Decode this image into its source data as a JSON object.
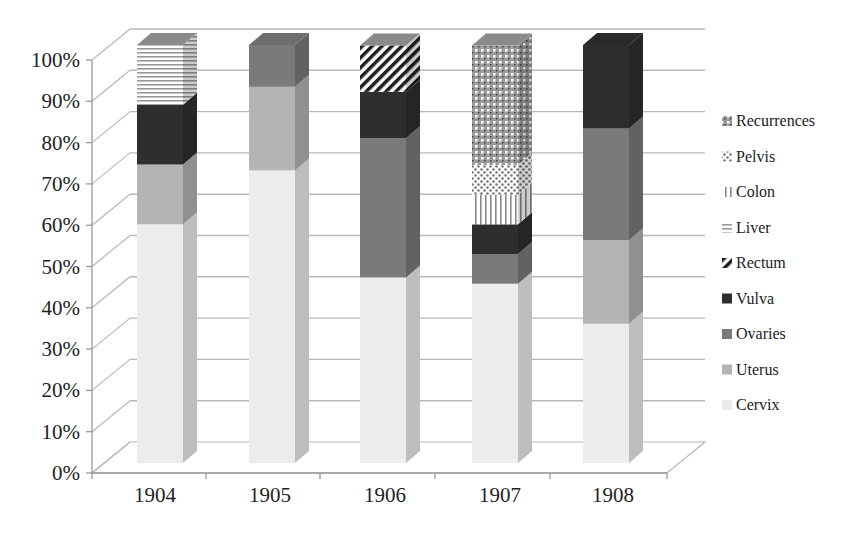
{
  "chart_data": {
    "type": "bar",
    "subtype": "3d-stacked-100-percent",
    "title": "",
    "xlabel": "",
    "ylabel": "",
    "categories": [
      "1904",
      "1905",
      "1906",
      "1907",
      "1908"
    ],
    "series": [
      {
        "name": "Cervix",
        "values": [
          57.1,
          70.0,
          44.4,
          42.9,
          33.3
        ]
      },
      {
        "name": "Uterus",
        "values": [
          14.3,
          20.0,
          0,
          0,
          20.0
        ]
      },
      {
        "name": "Ovaries",
        "values": [
          0,
          10.0,
          33.3,
          7.1,
          26.7
        ]
      },
      {
        "name": "Vulva",
        "values": [
          14.3,
          0,
          11.1,
          7.1,
          20.0
        ]
      },
      {
        "name": "Rectum",
        "values": [
          0,
          0,
          11.1,
          0,
          0
        ]
      },
      {
        "name": "Liver",
        "values": [
          14.3,
          0,
          0,
          0,
          0
        ]
      },
      {
        "name": "Colon",
        "values": [
          0,
          0,
          0,
          7.1,
          0
        ]
      },
      {
        "name": "Pelvis",
        "values": [
          0,
          0,
          0,
          7.1,
          0
        ]
      },
      {
        "name": "Recurrences",
        "values": [
          0,
          0,
          0,
          28.6,
          0
        ]
      }
    ],
    "yticks": [
      "0%",
      "10%",
      "20%",
      "30%",
      "40%",
      "50%",
      "60%",
      "70%",
      "80%",
      "90%",
      "100%"
    ],
    "ylim": [
      0,
      100
    ],
    "grid": true,
    "legend_position": "right",
    "legend_order": [
      "Recurrences",
      "Pelvis",
      "Colon",
      "Liver",
      "Rectum",
      "Vulva",
      "Ovaries",
      "Uterus",
      "Cervix"
    ]
  },
  "style": {
    "colors": {
      "Cervix": "#ececec",
      "Uterus": "#b4b4b4",
      "Ovaries": "#7a7a7a",
      "Vulva": "#2e2e2e",
      "Rectum": "pattern-diagonal",
      "Liver": "pattern-horizontal",
      "Colon": "pattern-vertical",
      "Pelvis": "pattern-dots",
      "Recurrences": "pattern-checker"
    },
    "legend_icons": {
      "Recurrences": "checker-swatch-icon",
      "Pelvis": "dots-swatch-icon",
      "Colon": "vertical-lines-swatch-icon",
      "Liver": "horizontal-lines-swatch-icon",
      "Rectum": "diagonal-lines-swatch-icon",
      "Vulva": "solid-swatch-icon",
      "Ovaries": "solid-swatch-icon",
      "Uterus": "solid-swatch-icon",
      "Cervix": "solid-swatch-icon"
    }
  }
}
